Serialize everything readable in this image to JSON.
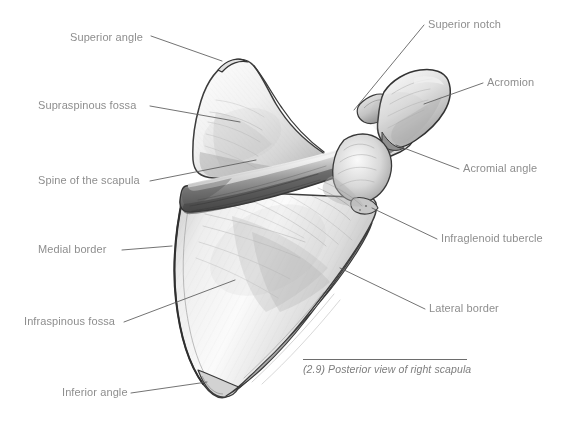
{
  "figure": {
    "title": "Posterior view of right scapula",
    "caption_number": "(2.9)",
    "caption_text": "(2.9) Posterior view of right scapula",
    "subject": "right scapula",
    "view": "posterior",
    "style": "graphite pencil anatomical drawing",
    "background_color": "#ffffff",
    "label_color": "#8e8e8e",
    "leader_color": "#5a5a5a",
    "caption_color": "#7e7e7e"
  },
  "labels": [
    {
      "id": "superior-angle",
      "text": "Superior angle",
      "side": "left",
      "text_x": 70,
      "text_y": 31,
      "line": [
        [
          151,
          36
        ],
        [
          222,
          61
        ]
      ]
    },
    {
      "id": "supraspinous-fossa",
      "text": "Supraspinous fossa",
      "side": "left",
      "text_x": 38,
      "text_y": 99,
      "line": [
        [
          150,
          106
        ],
        [
          240,
          122
        ]
      ]
    },
    {
      "id": "spine-of-the-scapula",
      "text": "Spine of the scapula",
      "side": "left",
      "text_x": 38,
      "text_y": 174,
      "line": [
        [
          150,
          181
        ],
        [
          256,
          160
        ]
      ]
    },
    {
      "id": "medial-border",
      "text": "Medial border",
      "side": "left",
      "text_x": 38,
      "text_y": 243,
      "line": [
        [
          122,
          250
        ],
        [
          172,
          246
        ]
      ]
    },
    {
      "id": "infraspinous-fossa",
      "text": "Infraspinous fossa",
      "side": "left",
      "text_x": 24,
      "text_y": 315,
      "line": [
        [
          124,
          322
        ],
        [
          235,
          280
        ]
      ]
    },
    {
      "id": "inferior-angle",
      "text": "Inferior angle",
      "side": "left",
      "text_x": 62,
      "text_y": 386,
      "line": [
        [
          131,
          393
        ],
        [
          207,
          382
        ]
      ]
    },
    {
      "id": "superior-notch",
      "text": "Superior notch",
      "side": "right",
      "text_x": 428,
      "text_y": 18,
      "line": [
        [
          424,
          25
        ],
        [
          354,
          110
        ]
      ]
    },
    {
      "id": "acromion",
      "text": "Acromion",
      "side": "right",
      "text_x": 487,
      "text_y": 76,
      "line": [
        [
          483,
          83
        ],
        [
          424,
          104
        ]
      ]
    },
    {
      "id": "acromial-angle",
      "text": "Acromial angle",
      "side": "right",
      "text_x": 463,
      "text_y": 162,
      "line": [
        [
          459,
          169
        ],
        [
          396,
          145
        ]
      ]
    },
    {
      "id": "infraglenoid-tubercle",
      "text": "Infraglenoid tubercle",
      "side": "right",
      "text_x": 441,
      "text_y": 232,
      "line": [
        [
          437,
          239
        ],
        [
          372,
          208
        ]
      ]
    },
    {
      "id": "lateral-border",
      "text": "Lateral border",
      "side": "right",
      "text_x": 429,
      "text_y": 302,
      "line": [
        [
          425,
          309
        ],
        [
          340,
          268
        ]
      ]
    }
  ]
}
